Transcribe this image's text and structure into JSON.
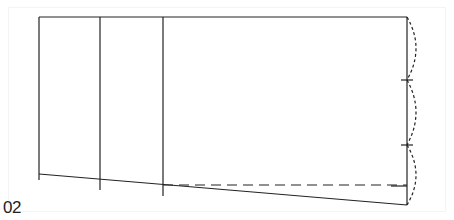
{
  "figure": {
    "label": "02",
    "colors": {
      "line": "#222222",
      "background": "#ffffff"
    }
  }
}
